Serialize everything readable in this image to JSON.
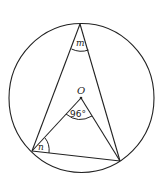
{
  "diagram": {
    "type": "circle-geometry",
    "center_label": "O",
    "labels": {
      "top_angle": "m",
      "left_angle": "n",
      "center_angle": "96°"
    },
    "colors": {
      "stroke": "#222222",
      "background": "#ffffff"
    }
  }
}
